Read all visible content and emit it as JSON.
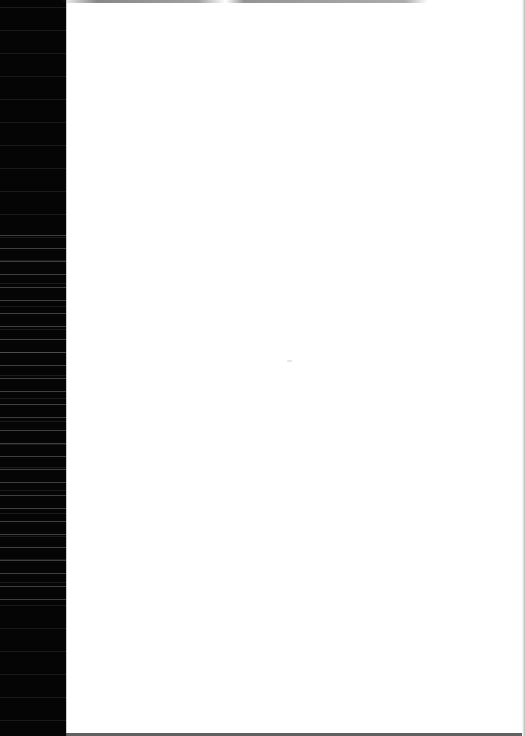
{
  "document": {
    "type": "scanned-page",
    "content": "",
    "state": "blank"
  },
  "colors": {
    "page": "#ffffff",
    "scan_edge": "#050505"
  }
}
